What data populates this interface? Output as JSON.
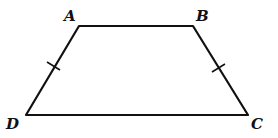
{
  "figure": {
    "type": "isosceles-trapezoid",
    "vertices": {
      "A": {
        "label": "A",
        "x": 79,
        "y": 26,
        "label_x": 64,
        "label_y": 21
      },
      "B": {
        "label": "B",
        "x": 193,
        "y": 26,
        "label_x": 196,
        "label_y": 21
      },
      "C": {
        "label": "C",
        "x": 248,
        "y": 115,
        "label_x": 251,
        "label_y": 129
      },
      "D": {
        "label": "D",
        "x": 26,
        "y": 115,
        "label_x": 6,
        "label_y": 129
      }
    },
    "tick_marks": [
      {
        "side": "AD",
        "x": 54,
        "y": 66
      },
      {
        "side": "BC",
        "x": 218,
        "y": 68
      }
    ],
    "stroke_color": "#111111"
  }
}
